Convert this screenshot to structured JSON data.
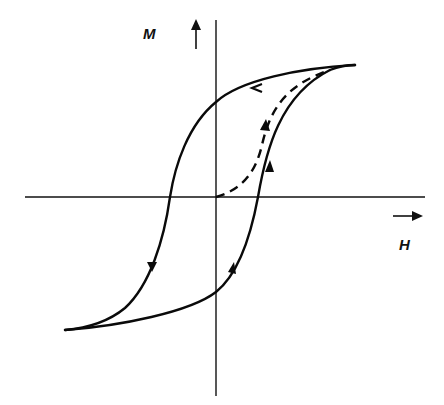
{
  "diagram": {
    "axes": {
      "vertical": {
        "label": "M",
        "arrow": "up-arrow"
      },
      "horizontal": {
        "label": "H",
        "arrow": "right-arrow"
      }
    },
    "curves": [
      {
        "name": "initial-magnetization-curve",
        "style": "dashed",
        "direction": "from origin to positive saturation"
      },
      {
        "name": "descending-branch",
        "style": "solid",
        "direction": "from positive saturation to negative saturation"
      },
      {
        "name": "ascending-branch",
        "style": "solid",
        "direction": "from negative saturation to positive saturation"
      }
    ],
    "colors": {
      "line": "#0a0a0a",
      "background": "#ffffff"
    }
  }
}
